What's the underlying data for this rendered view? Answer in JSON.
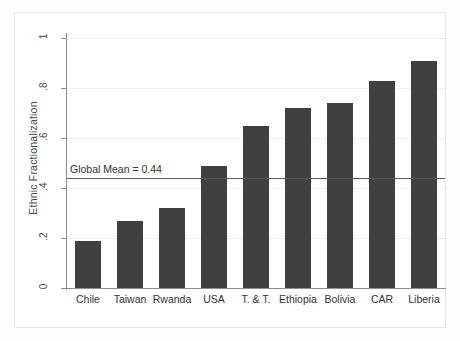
{
  "chart_data": {
    "type": "bar",
    "title": "",
    "xlabel": "",
    "ylabel": "Ethnic Fractionalization",
    "categories": [
      "Chile",
      "Taiwan",
      "Rwanda",
      "USA",
      "T. & T.",
      "Ethiopia",
      "Bolivia",
      "CAR",
      "Liberia"
    ],
    "values": [
      0.19,
      0.27,
      0.32,
      0.49,
      0.65,
      0.72,
      0.74,
      0.83,
      0.91
    ],
    "ylim": [
      0,
      1
    ],
    "yticks": [
      0,
      0.2,
      0.4,
      0.6,
      0.8,
      1
    ],
    "ytick_labels": [
      "0",
      ".2",
      ".4",
      ".6",
      ".8",
      "1"
    ],
    "grid": true,
    "legend": "none",
    "bar_color": "#404040",
    "gridline_color": "#f0f0f0",
    "axis_color": "#8e8e8e",
    "annotations": [
      {
        "name": "global-mean-line",
        "label": "Global Mean = 0.44",
        "value": 0.44,
        "orientation": "horizontal",
        "color": "#5a5a5a"
      }
    ]
  }
}
